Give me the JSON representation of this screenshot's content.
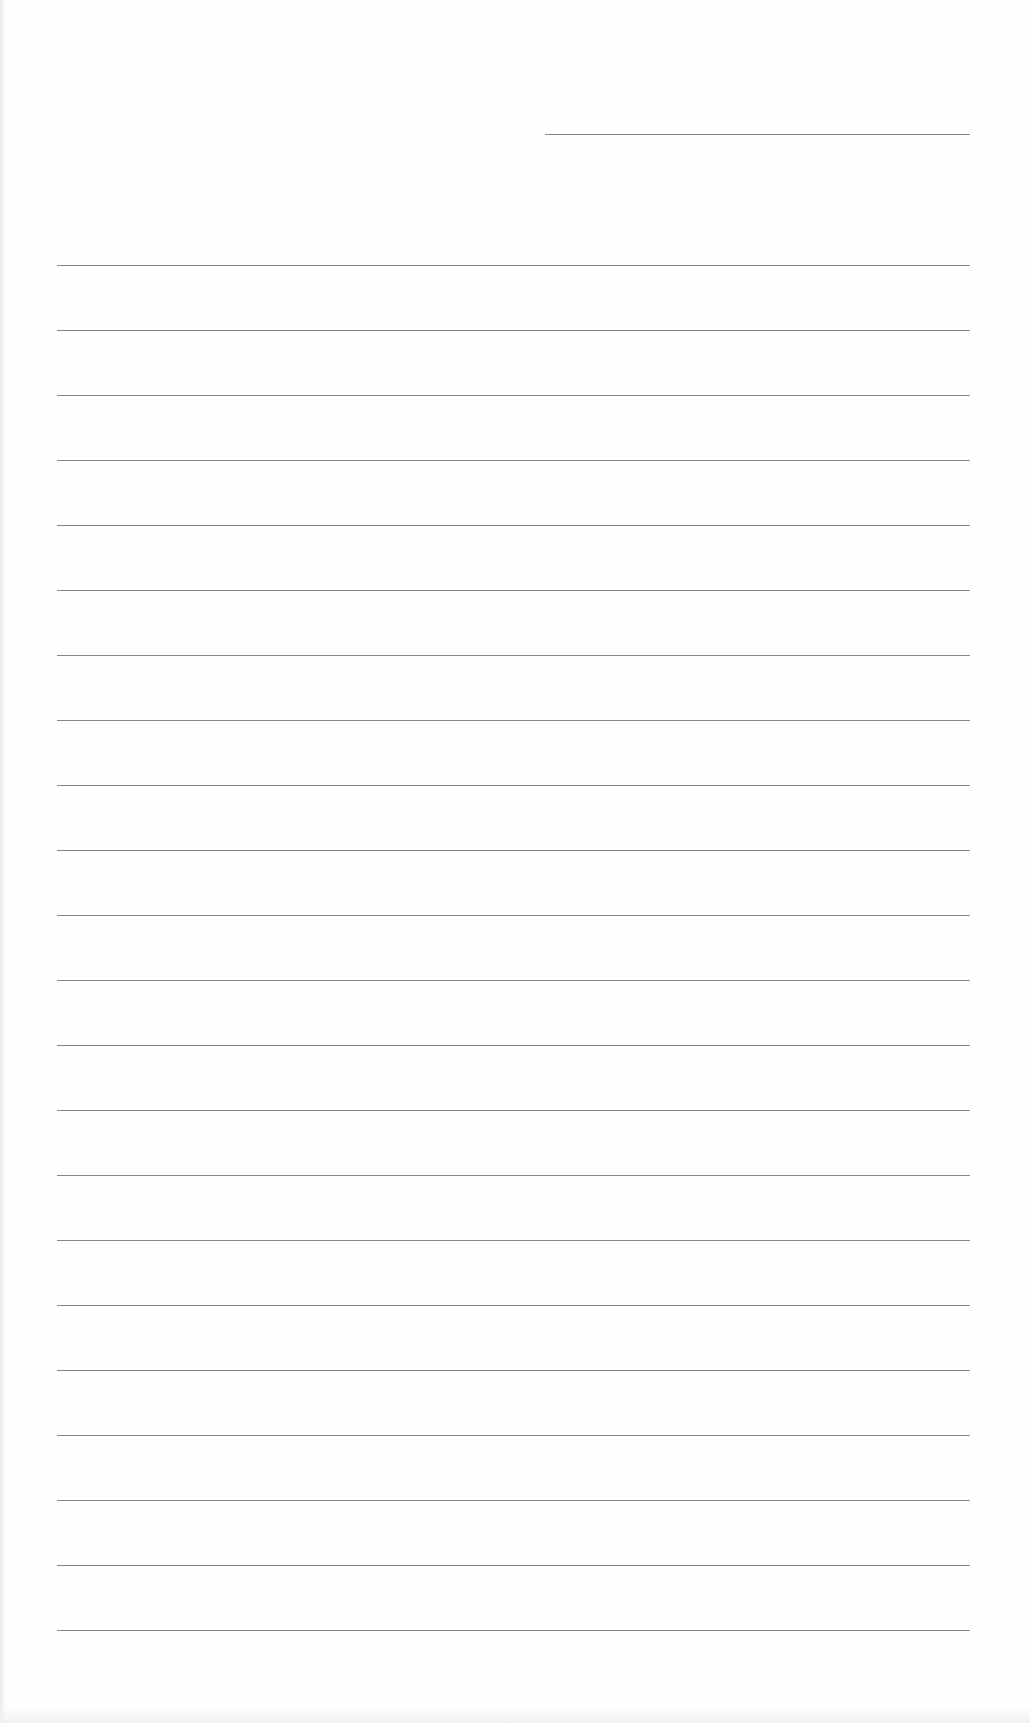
{
  "document": {
    "type": "lined-paper",
    "header_line": {
      "x": 545,
      "y": 134,
      "width": 425
    },
    "lines": {
      "count": 22,
      "start_y": 265,
      "spacing": 65,
      "left_x": 57,
      "right_x": 970
    },
    "colors": {
      "paper": "#fefefe",
      "rule": "#6e6e6e"
    }
  }
}
